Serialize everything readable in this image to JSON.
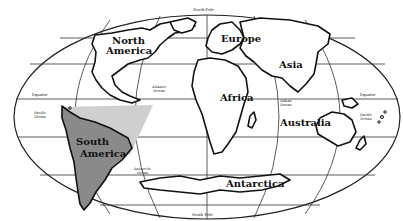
{
  "map": {
    "projection": "oval world map",
    "highlight": {
      "region": "South America",
      "fill": "#8a8a8a",
      "secondary_fill": "#cfcfcf"
    },
    "colors": {
      "outline": "#111111",
      "land": "#ffffff",
      "background": "#ffffff"
    }
  },
  "labels": {
    "continents": {
      "north_america_1": "North",
      "north_america_2": "America",
      "south_america_1": "South",
      "south_america_2": "America",
      "europe": "Europe",
      "asia": "Asia",
      "africa": "Africa",
      "australia": "Australia",
      "antarctica": "Antarctica"
    },
    "oceans": {
      "atlantic_1": "Atlantic",
      "atlantic_2": "Ocean",
      "pacific_west_1": "Pacific",
      "pacific_west_2": "Ocean",
      "pacific_east_1": "Pacific",
      "pacific_east_2": "Ocean",
      "indian_1": "Indian",
      "indian_2": "Ocean",
      "antarctic_1": "Antarctic",
      "antarctic_2": "Ocean"
    },
    "lines": {
      "north_pole": "North Pole",
      "south_pole": "South Pole",
      "equator_west": "Equator",
      "equator_east": "Equator"
    }
  }
}
